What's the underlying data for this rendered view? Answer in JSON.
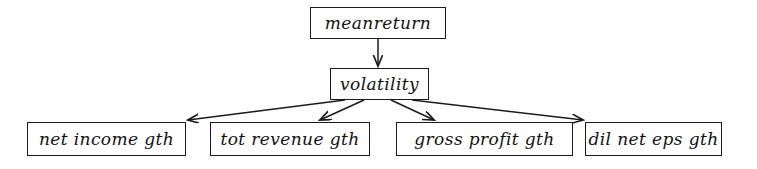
{
  "diagram": {
    "type": "directed-acyclic-graph",
    "background_color": "#ffffff",
    "line_color": "#1b1b1b",
    "text_color": "#111111",
    "nodes": {
      "root": {
        "label": "meanreturn"
      },
      "mid": {
        "label": "volatility"
      },
      "leaves": [
        {
          "label": "net income gth"
        },
        {
          "label": "tot revenue gth"
        },
        {
          "label": "gross profit gth"
        },
        {
          "label": "dil net eps gth"
        }
      ]
    },
    "edges": [
      {
        "from": "meanreturn",
        "to": "volatility"
      },
      {
        "from": "volatility",
        "to": "net income gth"
      },
      {
        "from": "volatility",
        "to": "tot revenue gth"
      },
      {
        "from": "volatility",
        "to": "gross profit gth"
      },
      {
        "from": "volatility",
        "to": "dil net eps gth"
      }
    ]
  }
}
